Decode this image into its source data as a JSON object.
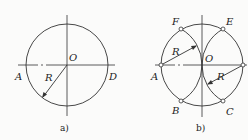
{
  "figure_a": {
    "caption": "a)",
    "labels": {
      "A": "A",
      "O": "O",
      "D": "D",
      "R": "R"
    },
    "center": [
      67,
      65
    ],
    "radius": 41
  },
  "figure_b": {
    "caption": "b)",
    "labels": {
      "A": "A",
      "B": "B",
      "C": "C",
      "D": "",
      "E": "E",
      "F": "F",
      "O": "O",
      "R1": "R",
      "R2": "R"
    },
    "center": [
      202,
      65
    ],
    "radius": 41,
    "points": {
      "A": [
        161,
        65
      ],
      "D": [
        243,
        65
      ],
      "F": [
        181,
        29
      ],
      "E": [
        223,
        29
      ],
      "B": [
        181,
        101
      ],
      "C": [
        223,
        101
      ]
    }
  },
  "colors": {
    "line": "#333333",
    "background": "#fbfbfa",
    "point_fill": "#ffffff"
  }
}
